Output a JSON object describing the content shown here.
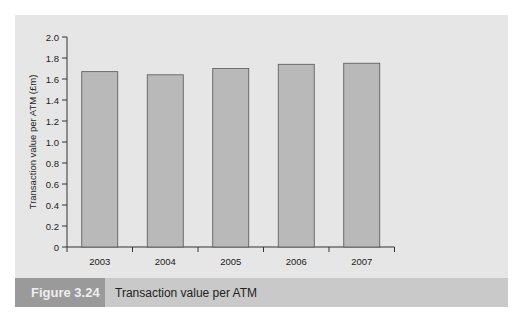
{
  "figure": {
    "label": "Figure 3.24",
    "title": "Transaction value per ATM"
  },
  "chart_data": {
    "type": "bar",
    "title": "Transaction value per ATM",
    "xlabel": "",
    "ylabel": "Transaction value per ATM (£m)",
    "categories": [
      "2003",
      "2004",
      "2005",
      "2006",
      "2007"
    ],
    "values": [
      1.67,
      1.64,
      1.7,
      1.74,
      1.75
    ],
    "ylim": [
      0,
      2.0
    ],
    "yticks": [
      "0",
      "0.2",
      "0.4",
      "0.6",
      "0.8",
      "1.0",
      "1.2",
      "1.4",
      "1.6",
      "1.8",
      "2.0"
    ],
    "grid": false,
    "legend": null,
    "colors": {
      "bar": "#b9b9b9",
      "bar_edge": "#555555",
      "axis": "#333333"
    }
  }
}
